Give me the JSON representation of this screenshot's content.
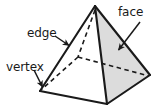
{
  "figure": {
    "shape_name": "square pyramid",
    "background_color": "#ffffff",
    "outline_color": "#1a1a1a",
    "shaded_face_color": "#dcdcdc",
    "unshaded_face_color": "#ffffff",
    "hidden_edge_style": "dashed"
  },
  "labels": {
    "edge": "edge",
    "vertex": "vertex",
    "face": "face"
  },
  "annotations": [
    {
      "id": "edge",
      "text": "edge",
      "arrow_from": [
        55,
        36
      ],
      "arrow_to": [
        70,
        46
      ],
      "points_at": "left slant edge of the pyramid"
    },
    {
      "id": "vertex",
      "text": "vertex",
      "arrow_from": [
        33,
        70
      ],
      "arrow_to": [
        43,
        88
      ],
      "points_at": "bottom-left base corner of the pyramid"
    },
    {
      "id": "face",
      "text": "face",
      "arrow_from": [
        140,
        22
      ],
      "arrow_to": [
        118,
        51
      ],
      "points_at": "shaded right triangular face of the pyramid"
    }
  ],
  "geometry": {
    "vertices": {
      "apex": [
        95,
        6
      ],
      "base_left": [
        40,
        91
      ],
      "base_front": [
        107,
        104
      ],
      "base_right": [
        150,
        75
      ],
      "base_back_hidden": [
        78,
        57
      ]
    },
    "visible_edges": [
      [
        "apex",
        "base_left"
      ],
      [
        "apex",
        "base_front"
      ],
      [
        "apex",
        "base_right"
      ],
      [
        "base_left",
        "base_front"
      ],
      [
        "base_front",
        "base_right"
      ]
    ],
    "hidden_edges": [
      [
        "apex",
        "base_back_hidden"
      ],
      [
        "base_back_hidden",
        "base_left"
      ],
      [
        "base_back_hidden",
        "base_right"
      ]
    ],
    "faces": [
      {
        "name": "front-left-face",
        "points": [
          "apex",
          "base_left",
          "base_front"
        ],
        "fill": "#ffffff"
      },
      {
        "name": "front-right-face",
        "points": [
          "apex",
          "base_front",
          "base_right"
        ],
        "fill": "#dcdcdc"
      }
    ]
  }
}
